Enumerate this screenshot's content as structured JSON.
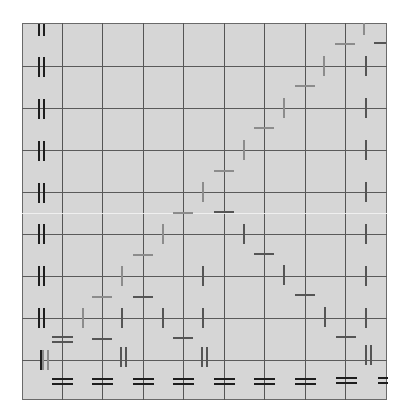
{
  "diagram": {
    "colors": {
      "board": "#d6d6d6",
      "grid": "#555555",
      "dark": "#1e1e1e",
      "mid": "#555555",
      "light": "#8c8c8c"
    },
    "grid": {
      "columns_x": [
        22,
        62,
        102,
        143,
        183,
        224,
        264,
        305,
        345,
        386
      ],
      "rows_y": [
        23,
        66,
        108,
        150,
        192,
        234,
        276,
        318,
        360,
        399
      ]
    },
    "single_marks": [
      {
        "o": "h",
        "x": 102,
        "y": 297,
        "c": "light"
      },
      {
        "o": "v",
        "x": 83,
        "y": 318,
        "c": "light"
      },
      {
        "o": "v",
        "x": 122,
        "y": 276,
        "c": "light"
      },
      {
        "o": "h",
        "x": 143,
        "y": 255,
        "c": "light"
      },
      {
        "o": "v",
        "x": 163,
        "y": 234,
        "c": "light"
      },
      {
        "o": "h",
        "x": 183,
        "y": 213,
        "c": "light"
      },
      {
        "o": "v",
        "x": 203,
        "y": 192,
        "c": "light"
      },
      {
        "o": "h",
        "x": 224,
        "y": 171,
        "c": "light"
      },
      {
        "o": "v",
        "x": 244,
        "y": 150,
        "c": "light"
      },
      {
        "o": "h",
        "x": 264,
        "y": 128,
        "c": "light"
      },
      {
        "o": "v",
        "x": 284,
        "y": 108,
        "c": "light"
      },
      {
        "o": "h",
        "x": 305,
        "y": 86,
        "c": "light"
      },
      {
        "o": "v",
        "x": 324,
        "y": 66,
        "c": "light"
      },
      {
        "o": "h",
        "x": 345,
        "y": 44,
        "c": "light"
      },
      {
        "o": "v",
        "x": 364,
        "y": 29,
        "c": "light",
        "short": true
      },
      {
        "o": "h",
        "x": 102,
        "y": 339,
        "c": "mid"
      },
      {
        "o": "v",
        "x": 122,
        "y": 318,
        "c": "mid"
      },
      {
        "o": "h",
        "x": 143,
        "y": 297,
        "c": "mid"
      },
      {
        "o": "v",
        "x": 163,
        "y": 318,
        "c": "mid"
      },
      {
        "o": "h",
        "x": 183,
        "y": 338,
        "c": "mid"
      },
      {
        "o": "v",
        "x": 203,
        "y": 318,
        "c": "mid"
      },
      {
        "o": "v",
        "x": 203,
        "y": 276,
        "c": "mid"
      },
      {
        "o": "h",
        "x": 224,
        "y": 212,
        "c": "mid"
      },
      {
        "o": "v",
        "x": 244,
        "y": 234,
        "c": "mid"
      },
      {
        "o": "h",
        "x": 264,
        "y": 254,
        "c": "mid"
      },
      {
        "o": "v",
        "x": 284,
        "y": 275,
        "c": "mid"
      },
      {
        "o": "h",
        "x": 305,
        "y": 295,
        "c": "mid"
      },
      {
        "o": "v",
        "x": 325,
        "y": 317,
        "c": "mid"
      },
      {
        "o": "h",
        "x": 346,
        "y": 337,
        "c": "mid"
      },
      {
        "o": "v",
        "x": 366,
        "y": 66,
        "c": "mid"
      },
      {
        "o": "v",
        "x": 366,
        "y": 108,
        "c": "mid"
      },
      {
        "o": "v",
        "x": 366,
        "y": 150,
        "c": "mid"
      },
      {
        "o": "v",
        "x": 366,
        "y": 192,
        "c": "mid"
      },
      {
        "o": "v",
        "x": 366,
        "y": 234,
        "c": "mid"
      },
      {
        "o": "v",
        "x": 366,
        "y": 276,
        "c": "mid"
      },
      {
        "o": "v",
        "x": 366,
        "y": 318,
        "c": "mid"
      },
      {
        "o": "h",
        "x": 380,
        "y": 43,
        "c": "mid",
        "short": true
      },
      {
        "o": "v",
        "x": 41,
        "y": 360,
        "c": "dark"
      }
    ],
    "double_vertical_marks": [
      {
        "x": 41,
        "y": 30,
        "c": "dark",
        "short": true
      },
      {
        "x": 41,
        "y": 67,
        "c": "dark"
      },
      {
        "x": 41,
        "y": 109,
        "c": "dark"
      },
      {
        "x": 41,
        "y": 151,
        "c": "dark"
      },
      {
        "x": 41,
        "y": 193,
        "c": "dark"
      },
      {
        "x": 41,
        "y": 234,
        "c": "dark"
      },
      {
        "x": 41,
        "y": 276,
        "c": "dark"
      },
      {
        "x": 41,
        "y": 318,
        "c": "dark"
      },
      {
        "x": 45,
        "y": 360,
        "c": "light"
      },
      {
        "x": 123,
        "y": 357,
        "c": "mid"
      },
      {
        "x": 204,
        "y": 357,
        "c": "mid"
      },
      {
        "x": 368,
        "y": 355,
        "c": "mid"
      }
    ],
    "double_horizontal_marks": [
      {
        "x": 62,
        "y": 339,
        "c": "mid"
      },
      {
        "x": 62,
        "y": 381,
        "c": "dark"
      },
      {
        "x": 102,
        "y": 381,
        "c": "dark"
      },
      {
        "x": 143,
        "y": 381,
        "c": "dark"
      },
      {
        "x": 183,
        "y": 381,
        "c": "dark"
      },
      {
        "x": 224,
        "y": 381,
        "c": "dark"
      },
      {
        "x": 264,
        "y": 381,
        "c": "dark"
      },
      {
        "x": 305,
        "y": 381,
        "c": "dark"
      },
      {
        "x": 346,
        "y": 380,
        "c": "dark"
      },
      {
        "x": 383,
        "y": 380,
        "c": "dark",
        "short": true
      }
    ]
  }
}
